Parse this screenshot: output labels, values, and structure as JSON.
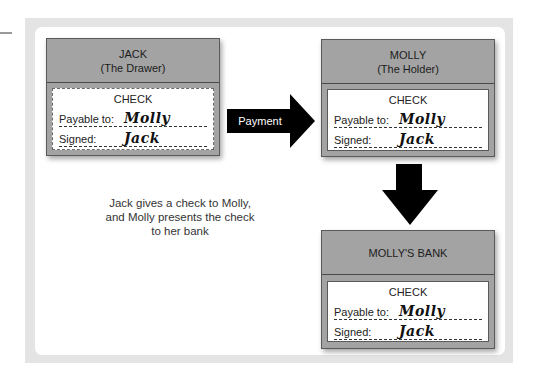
{
  "diagram": {
    "type": "check-flow",
    "parties": [
      {
        "name": "JACK",
        "role": "(The Drawer)",
        "check": {
          "title": "CHECK",
          "payable_label": "Payable to:",
          "payable_value": "Molly",
          "signed_label": "Signed:",
          "signed_value": "Jack",
          "border": "dashed"
        }
      },
      {
        "name": "MOLLY",
        "role": "(The Holder)",
        "check": {
          "title": "CHECK",
          "payable_label": "Payable to:",
          "payable_value": "Molly",
          "signed_label": "Signed:",
          "signed_value": "Jack",
          "border": "solid"
        }
      },
      {
        "name": "MOLLY'S BANK",
        "role": "",
        "check": {
          "title": "CHECK",
          "payable_label": "Payable to:",
          "payable_value": "Molly",
          "signed_label": "Signed:",
          "signed_value": "Jack",
          "border": "solid"
        }
      }
    ],
    "arrows": [
      {
        "from": "JACK",
        "to": "MOLLY",
        "label": "Payment",
        "direction": "right",
        "icon": "right-arrow-icon"
      },
      {
        "from": "MOLLY",
        "to": "MOLLY'S BANK",
        "label": "",
        "direction": "down",
        "icon": "down-arrow-icon"
      }
    ],
    "caption": {
      "lines": [
        "Jack gives a check to Molly,",
        "and Molly presents the check",
        "to her bank"
      ]
    },
    "colors": {
      "box_fill": "#a3a3a3",
      "box_border": "#5a5a5a",
      "arrow": "#000000",
      "frame": "#e4e4e4",
      "panel": "#ffffff"
    }
  }
}
